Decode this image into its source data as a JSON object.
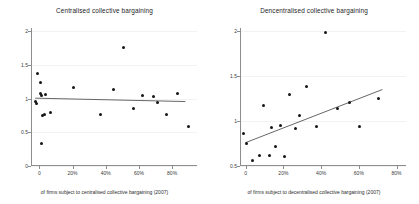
{
  "figure": {
    "width": 419,
    "height": 204,
    "background": "#ffffff",
    "dot_color": "#151515",
    "line_color": "#555555",
    "axis_color": "#8d8d8d",
    "grid_color": "#f2f2f2"
  },
  "chart_data": [
    {
      "type": "scatter",
      "panel": "left",
      "title": "Centralised collective bargaining",
      "xlabel": "of firms subject to centralised collective bargaining (2007)",
      "ylabel": "",
      "xlim": [
        -5,
        95
      ],
      "ylim": [
        0,
        2
      ],
      "xticks": [
        0,
        20,
        40,
        60,
        80
      ],
      "xticklabels": [
        "0",
        "20%",
        "40%",
        "60%",
        "80%"
      ],
      "yticks": [
        0,
        0.5,
        1,
        1.5,
        2
      ],
      "yticklabels": [
        "0",
        "0.5",
        "1",
        "1.5",
        "2"
      ],
      "grid": true,
      "legend": "none",
      "points": [
        {
          "x": -2.0,
          "y": 0.96
        },
        {
          "x": -1.5,
          "y": 0.93
        },
        {
          "x": -1.0,
          "y": 1.37
        },
        {
          "x": 0.5,
          "y": 1.24
        },
        {
          "x": 1.0,
          "y": 1.08
        },
        {
          "x": 1.5,
          "y": 1.05
        },
        {
          "x": 2.0,
          "y": 0.75
        },
        {
          "x": 3.5,
          "y": 1.06
        },
        {
          "x": 3.0,
          "y": 0.76
        },
        {
          "x": 1.5,
          "y": 0.33
        },
        {
          "x": 7.0,
          "y": 0.79
        },
        {
          "x": 20.5,
          "y": 1.16
        },
        {
          "x": 37.0,
          "y": 0.77
        },
        {
          "x": 44.5,
          "y": 1.13
        },
        {
          "x": 50.5,
          "y": 1.76
        },
        {
          "x": 56.5,
          "y": 0.85
        },
        {
          "x": 62.0,
          "y": 1.04
        },
        {
          "x": 68.5,
          "y": 1.03
        },
        {
          "x": 71.0,
          "y": 0.94
        },
        {
          "x": 76.5,
          "y": 0.76
        },
        {
          "x": 83.0,
          "y": 1.07
        },
        {
          "x": 90.0,
          "y": 0.58
        }
      ],
      "fit_line": {
        "x0": -2.5,
        "y0": 1.005,
        "x1": 88.0,
        "y1": 0.955
      }
    },
    {
      "type": "scatter",
      "panel": "right",
      "title": "Dencentralised collective bargaining",
      "xlabel": "of firms subject to decentralised collective bargaining (2007)",
      "ylabel": "",
      "xlim": [
        -3,
        85
      ],
      "ylim": [
        0.5,
        2
      ],
      "xticks": [
        0,
        20,
        40,
        60,
        80
      ],
      "xticklabels": [
        "0",
        "20%",
        "40%",
        "60%",
        "80%"
      ],
      "yticks": [
        0.5,
        1,
        1.5,
        2
      ],
      "yticklabels": [
        "0.5",
        "1",
        "1.5",
        "2"
      ],
      "grid": true,
      "legend": "none",
      "points": [
        {
          "x": -1.0,
          "y": 0.86
        },
        {
          "x": 0.5,
          "y": 0.75
        },
        {
          "x": 3.5,
          "y": 0.56
        },
        {
          "x": 7.5,
          "y": 0.62
        },
        {
          "x": 9.5,
          "y": 1.17
        },
        {
          "x": 12.5,
          "y": 0.62
        },
        {
          "x": 13.5,
          "y": 0.93
        },
        {
          "x": 16.0,
          "y": 0.72
        },
        {
          "x": 18.5,
          "y": 0.95
        },
        {
          "x": 20.5,
          "y": 0.61
        },
        {
          "x": 23.0,
          "y": 1.29
        },
        {
          "x": 26.5,
          "y": 0.92
        },
        {
          "x": 28.5,
          "y": 1.06
        },
        {
          "x": 32.5,
          "y": 1.38
        },
        {
          "x": 37.5,
          "y": 0.94
        },
        {
          "x": 42.5,
          "y": 1.98
        },
        {
          "x": 48.5,
          "y": 1.14
        },
        {
          "x": 55.0,
          "y": 1.21
        },
        {
          "x": 60.5,
          "y": 0.94
        },
        {
          "x": 70.5,
          "y": 1.25
        }
      ],
      "fit_line": {
        "x0": 0.0,
        "y0": 0.76,
        "x1": 72.5,
        "y1": 1.35
      }
    }
  ]
}
